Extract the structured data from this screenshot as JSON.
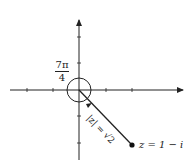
{
  "diagram": {
    "angle_label_num": "7π",
    "angle_label_den": "4",
    "modulus_label": "|z| = √2",
    "point_label": "z = 1 − i",
    "colors": {
      "ink": "#222222",
      "background": "#ffffff"
    }
  }
}
